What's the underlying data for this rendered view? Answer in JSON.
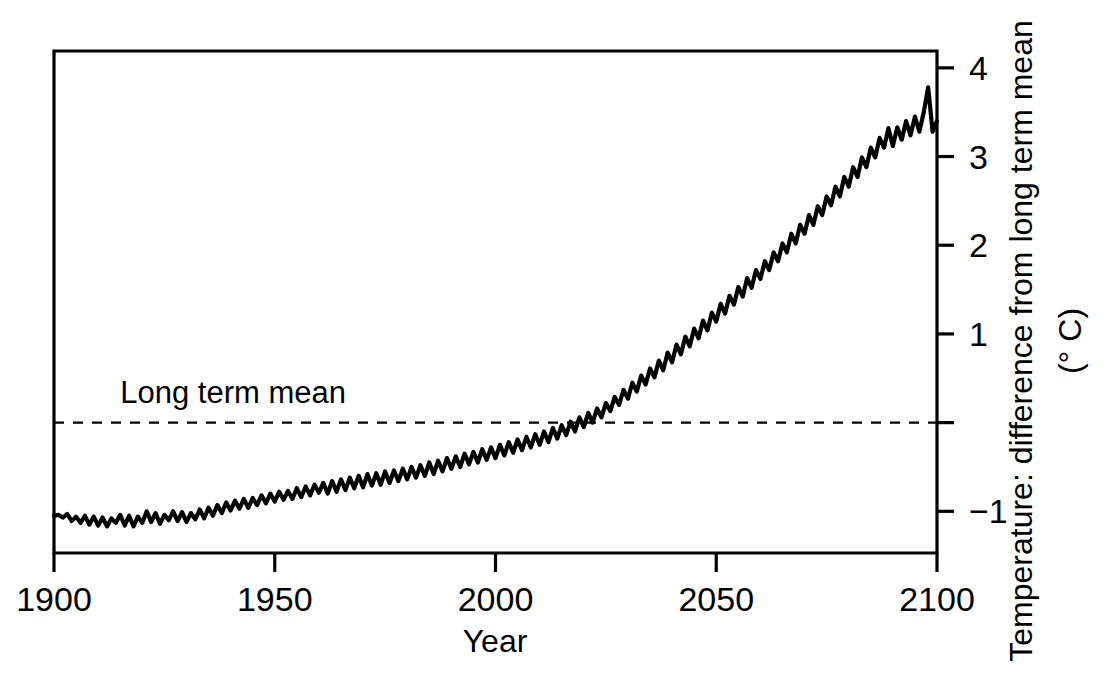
{
  "chart_data": {
    "type": "line",
    "title": "",
    "xlabel": "Year",
    "ylabel": "Temperature:  difference from long term mean",
    "ylabel_units": "(° C)",
    "xlim": [
      1900,
      2100
    ],
    "ylim": [
      -1.47,
      4.19
    ],
    "xticks": [
      1900,
      1950,
      2000,
      2050,
      2100
    ],
    "xticklabels": [
      "1900",
      "1950",
      "2000",
      "2050",
      "2100"
    ],
    "yticks": [
      -1,
      0,
      1,
      2,
      3,
      4
    ],
    "yticklabels": [
      "−1",
      "",
      "1",
      "2",
      "3",
      "4"
    ],
    "yaxis_position": "right",
    "grid": false,
    "legend": false,
    "annotations": [
      {
        "name": "long-term-mean-label",
        "text": "Long term mean",
        "x": 1915,
        "y": 0.22
      }
    ],
    "reference_lines": [
      {
        "name": "long-term-mean-line",
        "orientation": "horizontal",
        "value": 0,
        "style": "dashed",
        "label": "Long term mean"
      }
    ],
    "series": [
      {
        "name": "Temperature anomaly",
        "x": [
          1900,
          1901,
          1902,
          1903,
          1904,
          1905,
          1906,
          1907,
          1908,
          1909,
          1910,
          1911,
          1912,
          1913,
          1914,
          1915,
          1916,
          1917,
          1918,
          1919,
          1920,
          1921,
          1922,
          1923,
          1924,
          1925,
          1926,
          1927,
          1928,
          1929,
          1930,
          1931,
          1932,
          1933,
          1934,
          1935,
          1936,
          1937,
          1938,
          1939,
          1940,
          1941,
          1942,
          1943,
          1944,
          1945,
          1946,
          1947,
          1948,
          1949,
          1950,
          1951,
          1952,
          1953,
          1954,
          1955,
          1956,
          1957,
          1958,
          1959,
          1960,
          1961,
          1962,
          1963,
          1964,
          1965,
          1966,
          1967,
          1968,
          1969,
          1970,
          1971,
          1972,
          1973,
          1974,
          1975,
          1976,
          1977,
          1978,
          1979,
          1980,
          1981,
          1982,
          1983,
          1984,
          1985,
          1986,
          1987,
          1988,
          1989,
          1990,
          1991,
          1992,
          1993,
          1994,
          1995,
          1996,
          1997,
          1998,
          1999,
          2000,
          2001,
          2002,
          2003,
          2004,
          2005,
          2006,
          2007,
          2008,
          2009,
          2010,
          2011,
          2012,
          2013,
          2014,
          2015,
          2016,
          2017,
          2018,
          2019,
          2020,
          2021,
          2022,
          2023,
          2024,
          2025,
          2026,
          2027,
          2028,
          2029,
          2030,
          2031,
          2032,
          2033,
          2034,
          2035,
          2036,
          2037,
          2038,
          2039,
          2040,
          2041,
          2042,
          2043,
          2044,
          2045,
          2046,
          2047,
          2048,
          2049,
          2050,
          2051,
          2052,
          2053,
          2054,
          2055,
          2056,
          2057,
          2058,
          2059,
          2060,
          2061,
          2062,
          2063,
          2064,
          2065,
          2066,
          2067,
          2068,
          2069,
          2070,
          2071,
          2072,
          2073,
          2074,
          2075,
          2076,
          2077,
          2078,
          2079,
          2080,
          2081,
          2082,
          2083,
          2084,
          2085,
          2086,
          2087,
          2088,
          2089,
          2090,
          2091,
          2092,
          2093,
          2094,
          2095,
          2096,
          2097,
          2098,
          2099,
          2100
        ],
        "values": [
          -1.05,
          -1.04,
          -1.07,
          -1.03,
          -1.11,
          -1.06,
          -1.13,
          -1.05,
          -1.15,
          -1.06,
          -1.16,
          -1.07,
          -1.17,
          -1.08,
          -1.13,
          -1.04,
          -1.16,
          -1.05,
          -1.17,
          -1.06,
          -1.13,
          -1.0,
          -1.12,
          -1.02,
          -1.14,
          -1.04,
          -1.1,
          -1.0,
          -1.11,
          -1.01,
          -1.12,
          -1.02,
          -1.09,
          -0.98,
          -1.08,
          -0.96,
          -1.05,
          -0.93,
          -1.02,
          -0.9,
          -0.99,
          -0.88,
          -0.97,
          -0.86,
          -0.96,
          -0.85,
          -0.93,
          -0.82,
          -0.91,
          -0.8,
          -0.89,
          -0.78,
          -0.87,
          -0.77,
          -0.86,
          -0.74,
          -0.84,
          -0.72,
          -0.82,
          -0.7,
          -0.79,
          -0.68,
          -0.8,
          -0.66,
          -0.78,
          -0.64,
          -0.76,
          -0.62,
          -0.74,
          -0.6,
          -0.73,
          -0.58,
          -0.71,
          -0.57,
          -0.7,
          -0.55,
          -0.68,
          -0.54,
          -0.66,
          -0.52,
          -0.64,
          -0.5,
          -0.62,
          -0.48,
          -0.6,
          -0.45,
          -0.58,
          -0.43,
          -0.55,
          -0.4,
          -0.52,
          -0.38,
          -0.5,
          -0.35,
          -0.47,
          -0.33,
          -0.45,
          -0.3,
          -0.42,
          -0.28,
          -0.4,
          -0.25,
          -0.37,
          -0.22,
          -0.34,
          -0.19,
          -0.31,
          -0.16,
          -0.28,
          -0.13,
          -0.25,
          -0.1,
          -0.22,
          -0.06,
          -0.18,
          -0.03,
          -0.14,
          0.01,
          -0.1,
          0.06,
          -0.05,
          0.11,
          0.0,
          0.16,
          0.06,
          0.22,
          0.13,
          0.29,
          0.2,
          0.37,
          0.27,
          0.45,
          0.35,
          0.53,
          0.43,
          0.61,
          0.51,
          0.7,
          0.59,
          0.79,
          0.68,
          0.88,
          0.77,
          0.97,
          0.86,
          1.06,
          0.95,
          1.15,
          1.04,
          1.24,
          1.14,
          1.34,
          1.23,
          1.43,
          1.33,
          1.53,
          1.42,
          1.63,
          1.52,
          1.72,
          1.62,
          1.82,
          1.72,
          1.92,
          1.82,
          2.02,
          1.92,
          2.13,
          2.02,
          2.23,
          2.13,
          2.34,
          2.23,
          2.44,
          2.34,
          2.55,
          2.45,
          2.66,
          2.55,
          2.77,
          2.66,
          2.88,
          2.77,
          2.99,
          2.88,
          3.1,
          2.99,
          3.21,
          3.1,
          3.32,
          3.12,
          3.33,
          3.19,
          3.4,
          3.24,
          3.45,
          3.28,
          3.5,
          3.78,
          3.28,
          3.4
        ]
      }
    ]
  },
  "plot_geometry": {
    "left": 54,
    "right": 937,
    "top": 51,
    "bottom": 553
  }
}
